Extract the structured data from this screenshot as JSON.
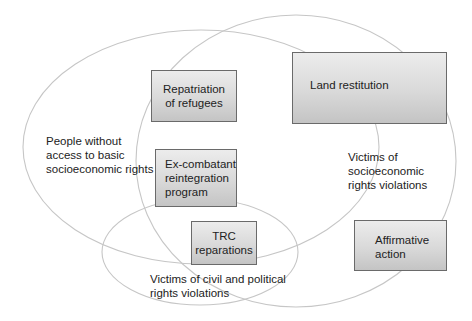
{
  "diagram": {
    "type": "venn",
    "sets": [
      {
        "id": "no-access",
        "label_lines": [
          "People without",
          "access to basic",
          "socioeconomic rights"
        ]
      },
      {
        "id": "socioeconomic-victims",
        "label_lines": [
          "Victims of",
          "socioeconomic",
          "rights violations"
        ]
      },
      {
        "id": "civil-political-victims",
        "label_lines": [
          "Victims of civil and political",
          "rights violations"
        ]
      }
    ],
    "programs": [
      {
        "id": "repatriation",
        "lines": [
          "Repatriation",
          "of refugees"
        ]
      },
      {
        "id": "land-restitution",
        "lines": [
          "Land restitution"
        ]
      },
      {
        "id": "ex-combatant",
        "lines": [
          "Ex-combatant",
          "reintegration",
          "program"
        ]
      },
      {
        "id": "trc",
        "lines": [
          "TRC",
          "reparations"
        ]
      },
      {
        "id": "affirmative-action",
        "lines": [
          "Affirmative",
          "action"
        ]
      }
    ],
    "colors": {
      "outline": "#c8c8c8",
      "box_border": "#6a6a6a",
      "box_fill_top": "#ececec",
      "box_fill_bottom": "#c4c4c4"
    }
  }
}
